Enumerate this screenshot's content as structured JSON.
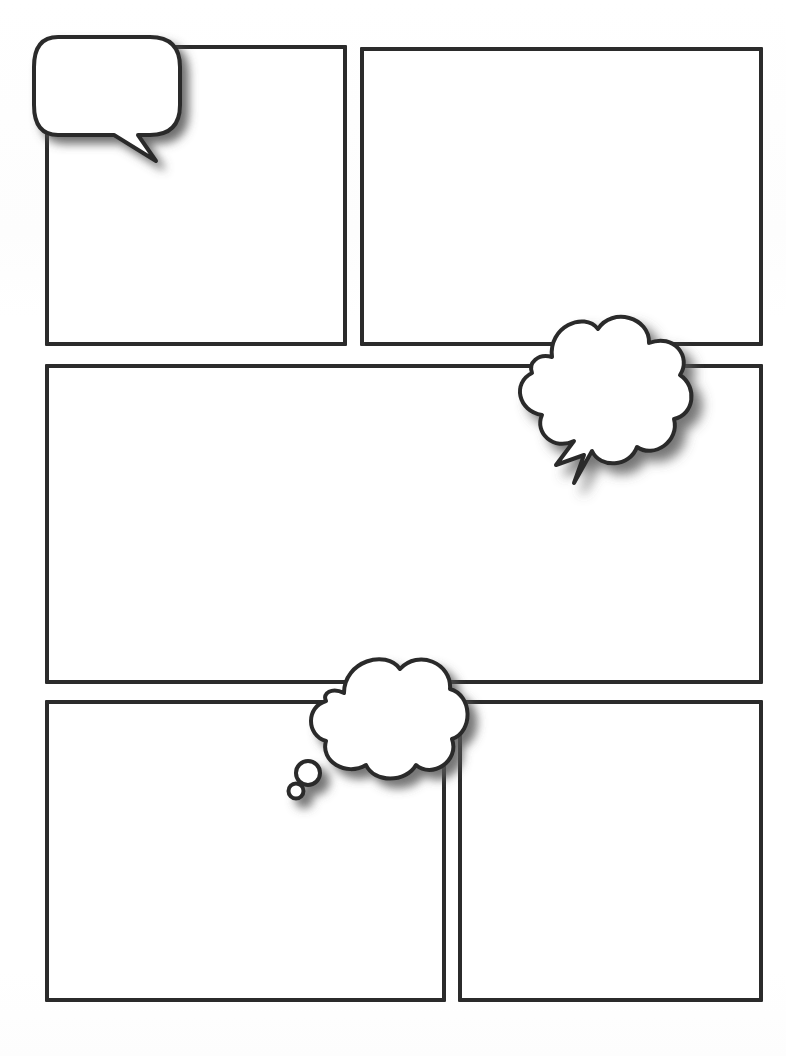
{
  "page": {
    "width": 786,
    "height": 1056,
    "background_color": "#ffffff",
    "ink_color": "#2b2b2b",
    "shadow_color": "#5a5a5a"
  },
  "panels": [
    {
      "id": "panel-1",
      "name": "top-left-panel",
      "label": "",
      "x": 45,
      "y": 45,
      "width": 302,
      "height": 301
    },
    {
      "id": "panel-2",
      "name": "top-right-panel",
      "label": "",
      "x": 360,
      "y": 47,
      "width": 403,
      "height": 299
    },
    {
      "id": "panel-3",
      "name": "middle-wide-panel",
      "label": "",
      "x": 45,
      "y": 364,
      "width": 718,
      "height": 320
    },
    {
      "id": "panel-4",
      "name": "bottom-left-panel",
      "label": "",
      "x": 45,
      "y": 700,
      "width": 401,
      "height": 302
    },
    {
      "id": "panel-5",
      "name": "bottom-right-panel",
      "label": "",
      "x": 458,
      "y": 700,
      "width": 305,
      "height": 302
    }
  ],
  "bubbles": [
    {
      "id": "bubble-1",
      "name": "speech-bubble",
      "kind": "speech",
      "text": "",
      "x": 30,
      "y": 33,
      "width": 160,
      "height": 130,
      "tail": "down-right"
    },
    {
      "id": "bubble-2",
      "name": "shout-bubble",
      "kind": "shout",
      "text": "",
      "x": 492,
      "y": 305,
      "width": 210,
      "height": 200,
      "tail": "lightning-bolt"
    },
    {
      "id": "bubble-3",
      "name": "thought-bubble",
      "kind": "thought",
      "text": "",
      "x": 282,
      "y": 645,
      "width": 190,
      "height": 160,
      "tail": "trailing-circles"
    }
  ]
}
